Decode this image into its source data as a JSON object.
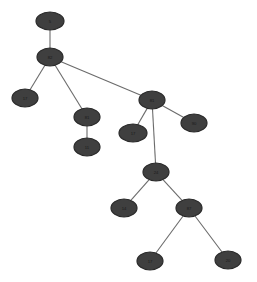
{
  "diagram": {
    "type": "tree",
    "title": "",
    "background_color": "#ffffff",
    "node_fill_color": "#3f3f3f",
    "node_stroke_color": "#2a2a2a",
    "edge_color": "#6b6b6b",
    "label_color": "#1a1a1a",
    "node_count": 13,
    "edge_count": 12,
    "nodes": [
      {
        "id": "n0",
        "label": "5",
        "cx": 50,
        "cy": 21,
        "rx": 14,
        "ry": 9
      },
      {
        "id": "n1",
        "label": "82",
        "cx": 50,
        "cy": 57,
        "rx": 13,
        "ry": 9
      },
      {
        "id": "n2",
        "label": "17",
        "cx": 25,
        "cy": 98,
        "rx": 13,
        "ry": 9
      },
      {
        "id": "n3",
        "label": "81",
        "cx": 87,
        "cy": 117,
        "rx": 13,
        "ry": 9
      },
      {
        "id": "n4",
        "label": "11",
        "cx": 87,
        "cy": 147,
        "rx": 13,
        "ry": 9
      },
      {
        "id": "n5",
        "label": "81",
        "cx": 152,
        "cy": 100,
        "rx": 13,
        "ry": 9
      },
      {
        "id": "n6",
        "label": "17",
        "cx": 133,
        "cy": 133,
        "rx": 14,
        "ry": 9
      },
      {
        "id": "n7",
        "label": "90",
        "cx": 194,
        "cy": 123,
        "rx": 13,
        "ry": 9
      },
      {
        "id": "n8",
        "label": "24",
        "cx": 156,
        "cy": 172,
        "rx": 13,
        "ry": 9
      },
      {
        "id": "n9",
        "label": "14",
        "cx": 124,
        "cy": 208,
        "rx": 13,
        "ry": 9
      },
      {
        "id": "n10",
        "label": "87",
        "cx": 189,
        "cy": 208,
        "rx": 13,
        "ry": 9
      },
      {
        "id": "n11",
        "label": "17",
        "cx": 150,
        "cy": 261,
        "rx": 13,
        "ry": 9
      },
      {
        "id": "n12",
        "label": "20",
        "cx": 228,
        "cy": 260,
        "rx": 13,
        "ry": 9
      }
    ],
    "edges": [
      {
        "from": "n0",
        "to": "n1"
      },
      {
        "from": "n1",
        "to": "n2"
      },
      {
        "from": "n1",
        "to": "n3"
      },
      {
        "from": "n1",
        "to": "n5"
      },
      {
        "from": "n3",
        "to": "n4"
      },
      {
        "from": "n5",
        "to": "n6"
      },
      {
        "from": "n5",
        "to": "n7"
      },
      {
        "from": "n5",
        "to": "n8"
      },
      {
        "from": "n8",
        "to": "n9"
      },
      {
        "from": "n8",
        "to": "n10"
      },
      {
        "from": "n10",
        "to": "n11"
      },
      {
        "from": "n10",
        "to": "n12"
      }
    ]
  }
}
